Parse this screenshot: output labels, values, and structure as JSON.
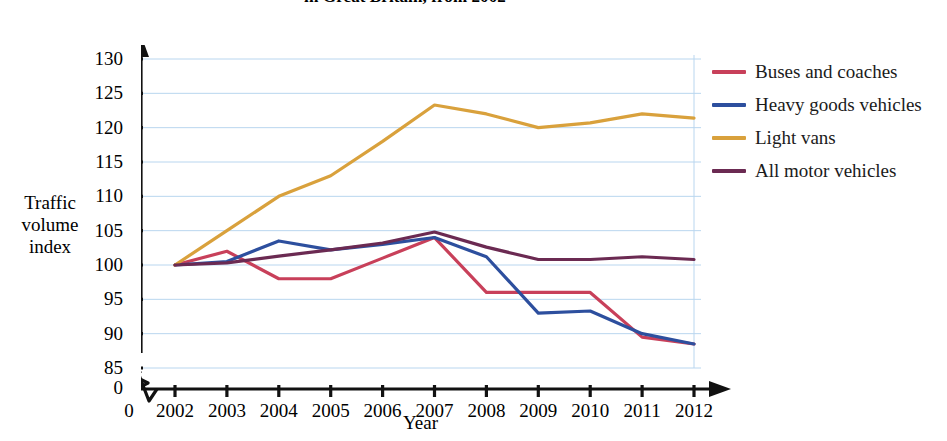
{
  "chart_data": {
    "type": "line",
    "title_line1": "in Great Britain, from 2002",
    "title_line2": "",
    "xlabel": "Year",
    "ylabel": "Traffic volume index",
    "ylabel_lines": [
      "Traffic",
      "volume",
      "index"
    ],
    "categories": [
      2002,
      2003,
      2004,
      2005,
      2006,
      2007,
      2008,
      2009,
      2010,
      2011,
      2012
    ],
    "x_tick_labels": [
      "2002",
      "2003",
      "2004",
      "2005",
      "2006",
      "2007",
      "2008",
      "2009",
      "2010",
      "2011",
      "2012"
    ],
    "y_tick_labels": [
      "85",
      "90",
      "95",
      "100",
      "105",
      "110",
      "115",
      "120",
      "125",
      "130"
    ],
    "y_ticks": [
      85,
      90,
      95,
      100,
      105,
      110,
      115,
      120,
      125,
      130
    ],
    "ylim": [
      85,
      130
    ],
    "y_axis_break": true,
    "x_axis_break": true,
    "origin_label": "0",
    "grid": true,
    "grid_color": "#b9d6ef",
    "legend_position": "right",
    "series": [
      {
        "name": "Buses and coaches",
        "color": "#c8405a",
        "values": [
          100,
          102,
          98,
          98,
          101,
          104,
          96,
          96,
          96,
          89.5,
          88.5
        ]
      },
      {
        "name": "Heavy goods vehicles",
        "color": "#2d4f9e",
        "values": [
          100,
          100.5,
          103.5,
          102.2,
          103,
          104,
          101.2,
          93,
          93.3,
          90,
          88.5
        ]
      },
      {
        "name": "Light vans",
        "color": "#d9a13c",
        "values": [
          100,
          105,
          110,
          113,
          118,
          123.3,
          122,
          120,
          120.7,
          122,
          121.4
        ]
      },
      {
        "name": "All motor vehicles",
        "color": "#6b2a52",
        "values": [
          100,
          100.3,
          101.3,
          102.2,
          103.2,
          104.8,
          102.6,
          100.8,
          100.8,
          101.2,
          100.8
        ]
      }
    ]
  },
  "legend": {
    "items": [
      {
        "label": "Buses and coaches",
        "color": "#c8405a"
      },
      {
        "label": "Heavy goods vehicles",
        "color": "#2d4f9e"
      },
      {
        "label": "Light vans",
        "color": "#d9a13c"
      },
      {
        "label": "All motor vehicles",
        "color": "#6b2a52"
      }
    ]
  }
}
